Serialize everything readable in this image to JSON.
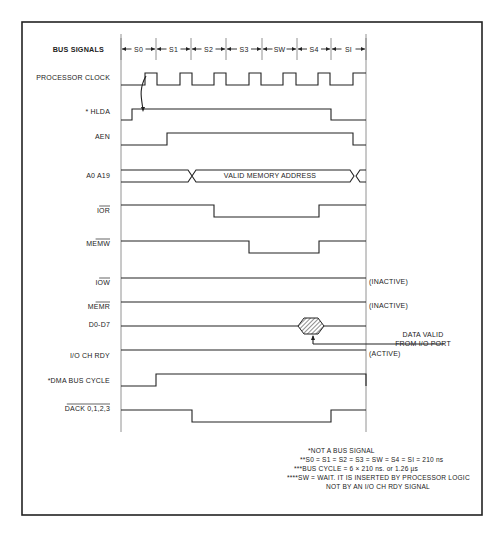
{
  "diagram": {
    "title_label": "BUS SIGNALS",
    "states": [
      "S0",
      "S1",
      "S2",
      "S3",
      "SW",
      "S4",
      "SI"
    ],
    "signals": [
      {
        "id": "clock",
        "label": "PROCESSOR CLOCK",
        "overbar": false
      },
      {
        "id": "hlda",
        "label": "* HLDA",
        "overbar": false
      },
      {
        "id": "aen",
        "label": "AEN",
        "overbar": false
      },
      {
        "id": "addr",
        "label": "A0 A19",
        "overbar": false,
        "bus_text": "VALID MEMORY ADDRESS"
      },
      {
        "id": "ior",
        "label": "IOR",
        "overbar": true
      },
      {
        "id": "memw",
        "label": "MEMW",
        "overbar": true
      },
      {
        "id": "iow",
        "label": "IOW",
        "overbar": true,
        "status": "(INACTIVE)"
      },
      {
        "id": "memr",
        "label": "MEMR",
        "overbar": true,
        "status": "(INACTIVE)"
      },
      {
        "id": "data",
        "label": "D0-D7",
        "overbar": false,
        "annotation": [
          "DATA VALID",
          "FROM I/O PORT"
        ]
      },
      {
        "id": "iochrdy",
        "label": "I/O CH RDY",
        "overbar": false,
        "status": "(ACTIVE)"
      },
      {
        "id": "dmacycle",
        "label": "*DMA BUS CYCLE",
        "overbar": false
      },
      {
        "id": "dack",
        "label": "DACK 0,1,2,3",
        "overbar": true
      }
    ],
    "notes": [
      "*NOT A BUS SIGNAL",
      "**S0 = S1 = S2 = S3 = SW = S4 = SI = 210 ns",
      "***BUS CYCLE = 6 × 210 ns. or 1.26 µs",
      "****SW = WAIT. IT IS INSERTED BY PROCESSOR LOGIC",
      "NOT BY AN I/O CH RDY SIGNAL"
    ]
  }
}
